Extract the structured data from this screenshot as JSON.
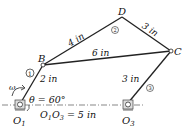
{
  "diagram": {
    "type": "four-bar linkage mechanism",
    "points": {
      "O1": {
        "label": "O",
        "sub": "1"
      },
      "O3": {
        "label": "O",
        "sub": "3"
      },
      "B": {
        "label": "B"
      },
      "C": {
        "label": "C"
      },
      "D": {
        "label": "D"
      }
    },
    "links": [
      {
        "id": "1",
        "from": "O1",
        "to": "B",
        "length_label": "2 in"
      },
      {
        "id": "2",
        "from": "B",
        "to": "D",
        "length_label": "4 in"
      },
      {
        "id": "2",
        "from": "B",
        "to": "C",
        "length_label": "6 in"
      },
      {
        "id": "2",
        "from": "D",
        "to": "C",
        "length_label": "3 in"
      },
      {
        "id": "3",
        "from": "O3",
        "to": "C",
        "length_label": "3 in"
      }
    ],
    "link_markers": {
      "m1": "1",
      "m2": "2",
      "m3": "3"
    },
    "labels": {
      "bd": "4 in",
      "dc": "3 in",
      "bc": "6 in",
      "o1b": "2 in",
      "o3c": "3 in",
      "omega": "ω",
      "theta": "θ = 60°",
      "ground_main": "O",
      "ground_sub1": "1",
      "ground_mid": "O",
      "ground_sub3": "3",
      "ground_tail": " = 5 in"
    },
    "colors": {
      "ink": "#1a1a1a",
      "background": "#ffffff"
    }
  }
}
